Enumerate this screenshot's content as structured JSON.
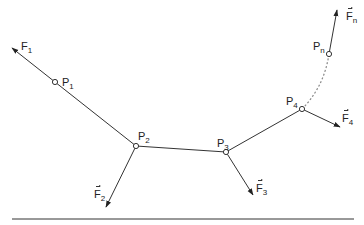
{
  "diagram": {
    "title": "",
    "colors": {
      "line": "#333333",
      "dashed": "#888888",
      "baseline": "#333333",
      "background": "#ffffff"
    },
    "points": [
      {
        "id": "P1",
        "label": "P",
        "sub": "1",
        "x": 55,
        "y": 82,
        "lx": 62,
        "ly": 77
      },
      {
        "id": "P2",
        "label": "P",
        "sub": "2",
        "x": 136,
        "y": 146,
        "lx": 138,
        "ly": 131
      },
      {
        "id": "P3",
        "label": "P",
        "sub": "3",
        "x": 226,
        "y": 152,
        "lx": 217,
        "ly": 138
      },
      {
        "id": "P4",
        "label": "P",
        "sub": "4",
        "x": 302,
        "y": 109,
        "lx": 286,
        "ly": 96
      },
      {
        "id": "Pn",
        "label": "P",
        "sub": "n",
        "x": 329,
        "y": 54,
        "lx": 313,
        "ly": 41
      }
    ],
    "forces": [
      {
        "id": "F1",
        "label": "F",
        "sub": "1",
        "vector": false,
        "from": [
          55,
          82
        ],
        "to": [
          12,
          48
        ],
        "lx": 21,
        "ly": 41
      },
      {
        "id": "F2",
        "label": "F",
        "sub": "2",
        "vector": true,
        "from": [
          136,
          146
        ],
        "to": [
          106,
          207
        ],
        "lx": 94,
        "ly": 189
      },
      {
        "id": "F3",
        "label": "F",
        "sub": "3",
        "vector": true,
        "from": [
          226,
          152
        ],
        "to": [
          253,
          195
        ],
        "lx": 256,
        "ly": 183
      },
      {
        "id": "F4",
        "label": "F",
        "sub": "4",
        "vector": true,
        "from": [
          302,
          109
        ],
        "to": [
          340,
          127
        ],
        "lx": 342,
        "ly": 113
      },
      {
        "id": "Fn",
        "label": "F",
        "sub": "n",
        "vector": true,
        "from": [
          329,
          54
        ],
        "to": [
          337,
          10
        ],
        "lx": 346,
        "ly": 11
      }
    ],
    "segments": [
      {
        "from": "P2",
        "to": "P3",
        "style": "solid"
      },
      {
        "from": "P3",
        "to": "P4",
        "style": "solid"
      },
      {
        "from": "P4",
        "to": "Pn",
        "style": "dashed"
      }
    ],
    "baseline": {
      "x1": 12,
      "x2": 354,
      "y": 219
    }
  }
}
